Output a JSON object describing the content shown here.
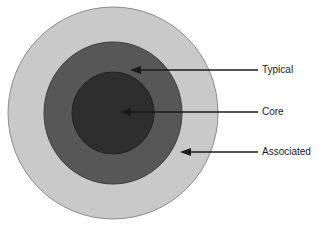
{
  "figure": {
    "background_color": "#ffffff",
    "width": 323,
    "height": 226
  },
  "diagram": {
    "type": "concentric-circles",
    "center": {
      "x": 113,
      "y": 113
    },
    "rings": [
      {
        "id": "outer",
        "label": "Associated",
        "fill": "#c9c9c9",
        "stroke": "#8c8c8c",
        "radius_x": 105,
        "radius_y": 106
      },
      {
        "id": "middle",
        "label": "Typical",
        "fill": "#575757",
        "stroke": "#3d3d3d",
        "radius_x": 69,
        "radius_y": 71
      },
      {
        "id": "inner",
        "label": "Core",
        "fill": "#2e2e2e",
        "stroke": "#232323",
        "radius_x": 41,
        "radius_y": 41
      }
    ]
  },
  "annotations": {
    "line_color": "#1a1a1a",
    "items": [
      {
        "id": "typical",
        "label": "Typical",
        "text_x": 262,
        "text_y": 70,
        "line_x1": 258,
        "line_x2": 132,
        "line_y": 70,
        "arrow_tip_x": 130
      },
      {
        "id": "core",
        "label": "Core",
        "text_x": 262,
        "text_y": 112,
        "line_x1": 258,
        "line_x2": 122,
        "line_y": 112,
        "arrow_tip_x": 120
      },
      {
        "id": "associated",
        "label": "Associated",
        "text_x": 262,
        "text_y": 152,
        "line_x1": 258,
        "line_x2": 182,
        "line_y": 152,
        "arrow_tip_x": 180
      }
    ]
  }
}
